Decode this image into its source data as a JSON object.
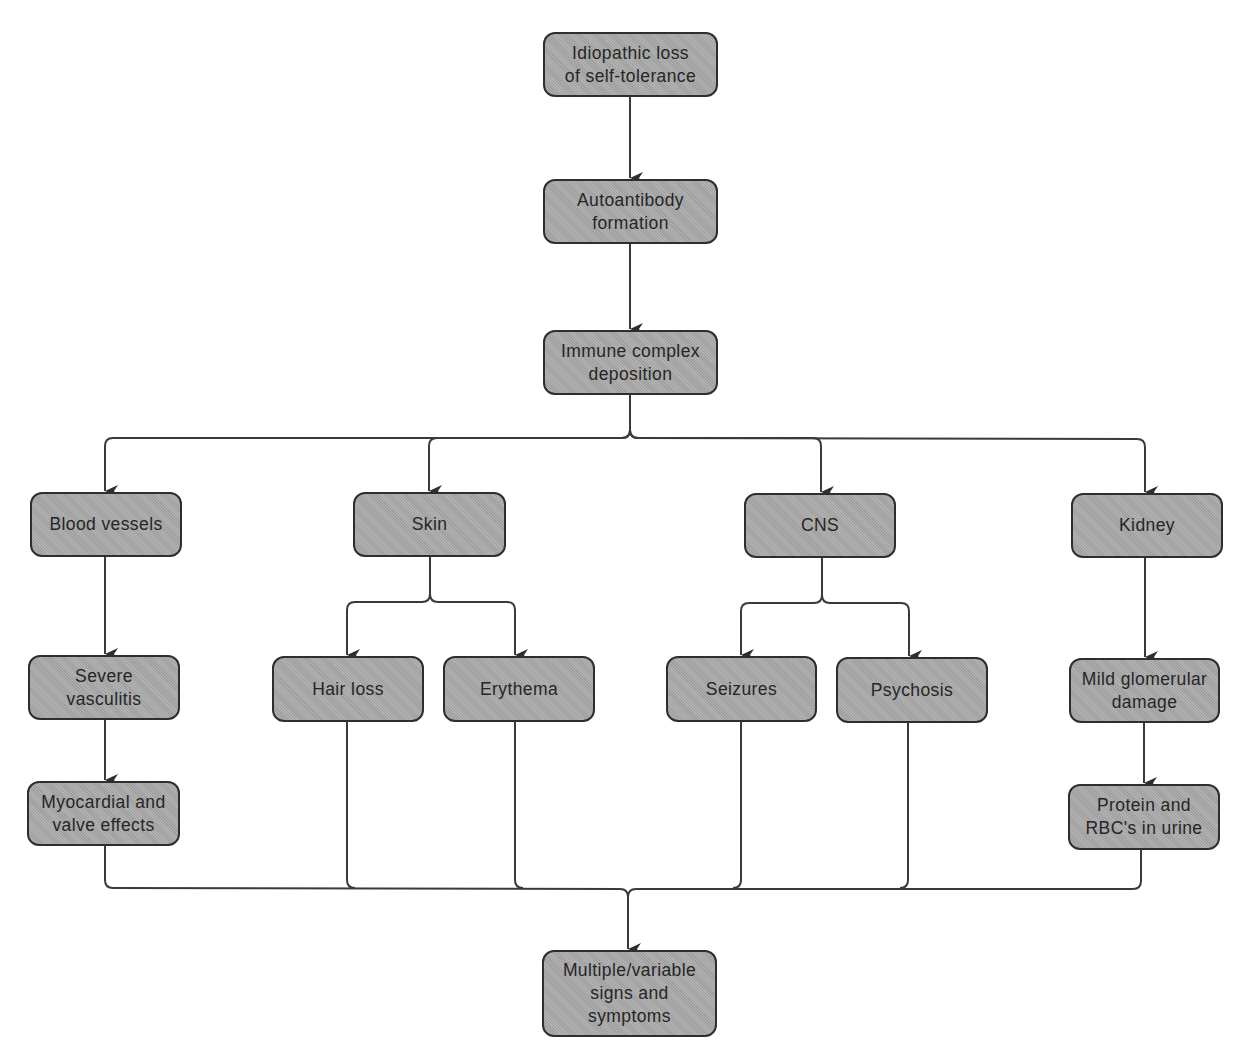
{
  "diagram": {
    "type": "flowchart",
    "colors": {
      "node_fill": "#a9a9a9",
      "node_border": "#2e2e2e",
      "line": "#3a3a3a",
      "text": "#262626",
      "background": "#ffffff"
    },
    "nodes": {
      "root": "Idiopathic loss\nof self-tolerance",
      "autoantibody": "Autoantibody\nformation",
      "immune": "Immune complex\ndeposition",
      "blood_vessels": "Blood vessels",
      "skin": "Skin",
      "cns": "CNS",
      "kidney": "Kidney",
      "severe_vasculitis": "Severe\nvasculitis",
      "hair_loss": "Hair loss",
      "erythema": "Erythema",
      "seizures": "Seizures",
      "psychosis": "Psychosis",
      "mild_glomerular": "Mild glomerular\ndamage",
      "myocardial": "Myocardial and\nvalve effects",
      "protein": "Protein and\nRBC's in urine",
      "outcome": "Multiple/variable\nsigns and\nsymptoms"
    },
    "edges": [
      [
        "root",
        "autoantibody"
      ],
      [
        "autoantibody",
        "immune"
      ],
      [
        "immune",
        "blood_vessels"
      ],
      [
        "immune",
        "skin"
      ],
      [
        "immune",
        "cns"
      ],
      [
        "immune",
        "kidney"
      ],
      [
        "blood_vessels",
        "severe_vasculitis"
      ],
      [
        "severe_vasculitis",
        "myocardial"
      ],
      [
        "skin",
        "hair_loss"
      ],
      [
        "skin",
        "erythema"
      ],
      [
        "cns",
        "seizures"
      ],
      [
        "cns",
        "psychosis"
      ],
      [
        "kidney",
        "mild_glomerular"
      ],
      [
        "mild_glomerular",
        "protein"
      ],
      [
        "myocardial",
        "outcome"
      ],
      [
        "hair_loss",
        "outcome"
      ],
      [
        "erythema",
        "outcome"
      ],
      [
        "seizures",
        "outcome"
      ],
      [
        "psychosis",
        "outcome"
      ],
      [
        "protein",
        "outcome"
      ]
    ]
  }
}
